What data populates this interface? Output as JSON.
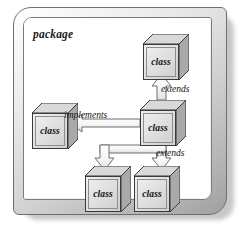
{
  "diagram": {
    "type": "uml-package-diagram",
    "package_label": "package",
    "colors": {
      "frame_border": "#6f6f6f",
      "panel_background": "#ffffff",
      "cube_front": "#e2e2e2",
      "cube_top": "#d8d8d8",
      "cube_side": "#a8a8a8",
      "cube_outline": "#3a3a3a",
      "connector_fill": "#f4f4f4",
      "connector_outline": "#6e6e6e",
      "text": "#111111",
      "shadow": "#9a9a9a"
    },
    "nodes": [
      {
        "id": "class-top-right",
        "label": "class",
        "x": 143,
        "y": 34
      },
      {
        "id": "class-left",
        "label": "class",
        "x": 32,
        "y": 103
      },
      {
        "id": "class-center",
        "label": "class",
        "x": 140,
        "y": 100
      },
      {
        "id": "class-bottom-left",
        "label": "class",
        "x": 85,
        "y": 166
      },
      {
        "id": "class-bottom-right",
        "label": "class",
        "x": 134,
        "y": 166
      }
    ],
    "edges": [
      {
        "id": "edge-extends-top",
        "label": "extends",
        "kind": "inheritance",
        "from": "class-center",
        "to": "class-top-right",
        "arrow": "hollow-triangle-up"
      },
      {
        "id": "edge-implements",
        "label": "implements",
        "kind": "realization",
        "from": "class-center",
        "to": "class-left",
        "arrow": "hollow-triangle-left"
      },
      {
        "id": "edge-extends-bottom",
        "label": "extends",
        "kind": "inheritance",
        "from": "class-bottom-left,class-bottom-right",
        "to": "class-center",
        "arrow": "hollow-triangle-down-branching"
      }
    ]
  }
}
